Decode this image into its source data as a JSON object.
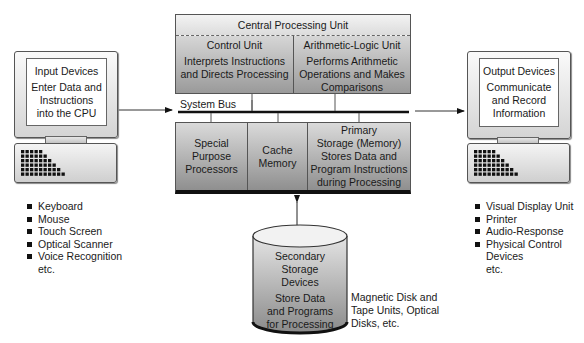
{
  "cpu": {
    "title": "Central Processing Unit",
    "control_unit": {
      "title": "Control Unit",
      "lines": [
        "Interprets Instructions",
        "and Directs Processing"
      ]
    },
    "alu": {
      "title": "Arithmetic-Logic Unit",
      "lines": [
        "Performs Arithmetic",
        "Operations and Makes",
        "Comparisons"
      ]
    }
  },
  "system_bus": {
    "label": "System Bus"
  },
  "lower_units": {
    "special": {
      "lines": [
        "Special",
        "Purpose",
        "Processors"
      ]
    },
    "cache": {
      "lines": [
        "Cache",
        "Memory"
      ]
    },
    "primary": {
      "lines": [
        "Primary",
        "Storage (Memory)",
        "Stores Data and",
        "Program Instructions",
        "during Processing"
      ]
    }
  },
  "input": {
    "title": "Input Devices",
    "lines": [
      "Enter Data and",
      "Instructions",
      "into the CPU"
    ],
    "examples": [
      "Keyboard",
      "Mouse",
      "Touch Screen",
      "Optical Scanner",
      "Voice Recognition"
    ],
    "etc": "etc."
  },
  "output": {
    "title": "Output Devices",
    "lines": [
      "Communicate",
      "and Record",
      "Information"
    ],
    "examples": [
      "Visual Display Unit",
      "Printer",
      "Audio-Response",
      "Physical Control"
    ],
    "examples_cont": "Devices",
    "etc": "etc."
  },
  "secondary": {
    "lines": [
      "Secondary",
      "Storage",
      "Devices"
    ],
    "desc": [
      "Store Data",
      "and Programs",
      "for Processing"
    ],
    "examples": [
      "Magnetic Disk and",
      "Tape Units, Optical",
      "Disks, etc."
    ]
  }
}
